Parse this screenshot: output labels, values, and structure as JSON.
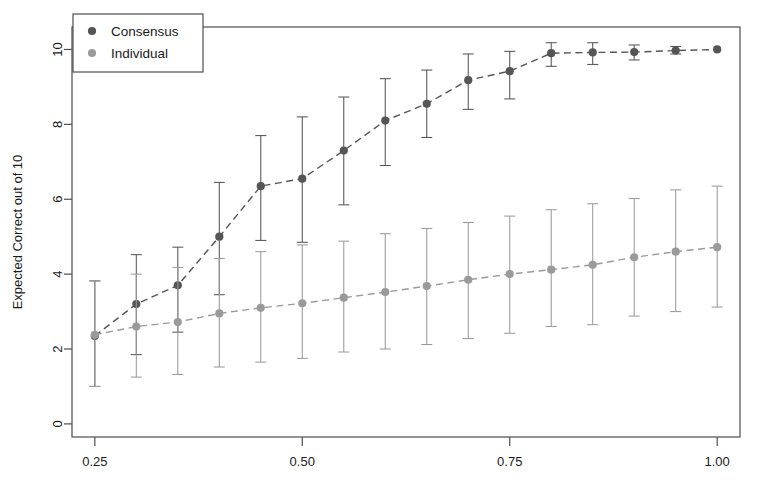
{
  "chart_data": {
    "type": "line",
    "title": "",
    "xlabel": "",
    "ylabel": "Expected Correct out of 10",
    "xlim": [
      0.2225,
      1.0275
    ],
    "ylim": [
      -0.35,
      10.6
    ],
    "grid": false,
    "xticks": [
      0.25,
      0.5,
      0.75,
      1.0
    ],
    "xticklabels": [
      "0.25",
      "0.50",
      "0.75",
      "1.00"
    ],
    "yticks": [
      0,
      2,
      4,
      6,
      8,
      10
    ],
    "yticklabels": [
      "0",
      "2",
      "4",
      "6",
      "8",
      "10"
    ],
    "legend": {
      "position": "top-left",
      "entries": [
        {
          "label": "Consensus",
          "color": "#555555"
        },
        {
          "label": "Individual",
          "color": "#9a9a9a"
        }
      ]
    },
    "x": [
      0.25,
      0.3,
      0.35,
      0.4,
      0.45,
      0.5,
      0.55,
      0.6,
      0.65,
      0.7,
      0.75,
      0.8,
      0.85,
      0.9,
      0.95,
      1.0
    ],
    "series": [
      {
        "name": "Consensus",
        "color": "#555555",
        "linestyle": "dashed",
        "marker": "circle",
        "values": [
          2.35,
          3.2,
          3.7,
          5.0,
          6.35,
          6.55,
          7.3,
          8.1,
          8.55,
          9.18,
          9.42,
          9.9,
          9.92,
          9.93,
          9.97,
          10.0
        ],
        "err_low": [
          1.0,
          1.85,
          2.45,
          3.45,
          4.9,
          4.85,
          5.85,
          6.9,
          7.65,
          8.4,
          8.68,
          9.55,
          9.6,
          9.72,
          9.88,
          10.0
        ],
        "err_high": [
          3.82,
          4.52,
          4.72,
          6.45,
          7.7,
          8.2,
          8.73,
          9.22,
          9.45,
          9.88,
          9.95,
          10.18,
          10.18,
          10.12,
          10.08,
          10.0
        ]
      },
      {
        "name": "Individual",
        "color": "#9a9a9a",
        "linestyle": "dashed",
        "marker": "circle",
        "values": [
          2.38,
          2.6,
          2.72,
          2.95,
          3.1,
          3.22,
          3.37,
          3.52,
          3.68,
          3.85,
          4.0,
          4.12,
          4.25,
          4.45,
          4.6,
          4.72
        ],
        "err_low": [
          1.0,
          1.25,
          1.32,
          1.52,
          1.65,
          1.75,
          1.92,
          2.0,
          2.12,
          2.28,
          2.42,
          2.6,
          2.65,
          2.88,
          3.0,
          3.12
        ],
        "err_high": [
          3.82,
          4.0,
          4.18,
          4.42,
          4.6,
          4.78,
          4.88,
          5.08,
          5.22,
          5.38,
          5.55,
          5.72,
          5.88,
          6.02,
          6.25,
          6.35
        ]
      }
    ]
  },
  "axes": {
    "ylabel": "Expected Correct out of 10"
  }
}
